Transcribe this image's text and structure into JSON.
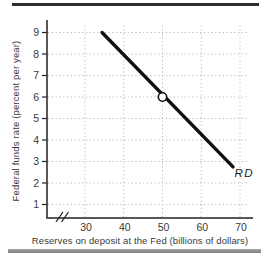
{
  "figure": {
    "y_axis_label": "Federal funds rate (percent per year)",
    "x_axis_label": "Reserves on deposit at the Fed (billions of dollars)",
    "line_label": "RD"
  },
  "chart_data": {
    "type": "line",
    "title": "",
    "xlabel": "Reserves on deposit at the Fed (billions of dollars)",
    "ylabel": "Federal funds rate (percent per year)",
    "x_ticks": [
      30,
      40,
      50,
      60,
      70
    ],
    "y_ticks": [
      1,
      2,
      3,
      4,
      5,
      6,
      7,
      8,
      9
    ],
    "xlim": [
      20,
      73
    ],
    "ylim": [
      0,
      9.6
    ],
    "grid": "dotted",
    "axis_break_x": true,
    "legend_position": "none",
    "series": [
      {
        "name": "RD",
        "points": [
          [
            34.4,
            9.0
          ],
          [
            68.2,
            2.75
          ]
        ],
        "color": "#111111"
      }
    ],
    "markers": [
      {
        "x": 50,
        "y": 6,
        "style": "open-circle"
      }
    ],
    "annotations": [
      {
        "text": "RD",
        "x": 68.6,
        "y": 2.28,
        "style": "italic"
      }
    ]
  },
  "colors": {
    "background": "#ffffff",
    "axis": "#222222",
    "grid": "#b8b8b8",
    "text": "#3a3a3a",
    "line": "#111111",
    "top_rule": "#2d2d2d",
    "bottom_rule": "#8f8f8f"
  }
}
